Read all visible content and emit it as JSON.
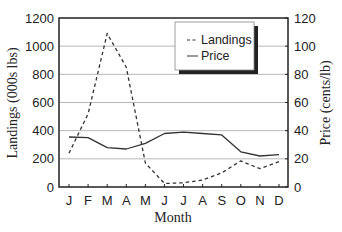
{
  "chart_data": {
    "type": "line",
    "title": "",
    "xlabel": "Month",
    "ylabel": "Landings (000s lbs)",
    "y2label": "Price (cents/lb)",
    "categories": [
      "J",
      "F",
      "M",
      "A",
      "M",
      "J",
      "J",
      "A",
      "S",
      "O",
      "N",
      "D"
    ],
    "ylim": [
      0,
      1200
    ],
    "y2lim": [
      0,
      120
    ],
    "yticks": [
      0,
      200,
      400,
      600,
      800,
      1000,
      1200
    ],
    "y2ticks": [
      0,
      20,
      40,
      60,
      80,
      100,
      120
    ],
    "grid": true,
    "legend_position": "upper right (inset)",
    "series": [
      {
        "name": "Landings",
        "axis": "left",
        "style": "dashed",
        "values": [
          240,
          520,
          1090,
          850,
          170,
          25,
          30,
          50,
          100,
          185,
          130,
          180
        ]
      },
      {
        "name": "Price",
        "axis": "right",
        "style": "solid",
        "values": [
          35.5,
          35,
          28,
          27,
          31,
          38,
          39,
          38,
          37,
          25,
          22,
          23
        ]
      }
    ]
  },
  "legend": {
    "items": [
      {
        "marker": "- -",
        "label": "Landings"
      },
      {
        "marker": "—",
        "label": "Price"
      }
    ]
  },
  "colors": {
    "line": "#333333",
    "grid": "#b8b8b8",
    "axis": "#222222",
    "background": "#ffffff"
  }
}
